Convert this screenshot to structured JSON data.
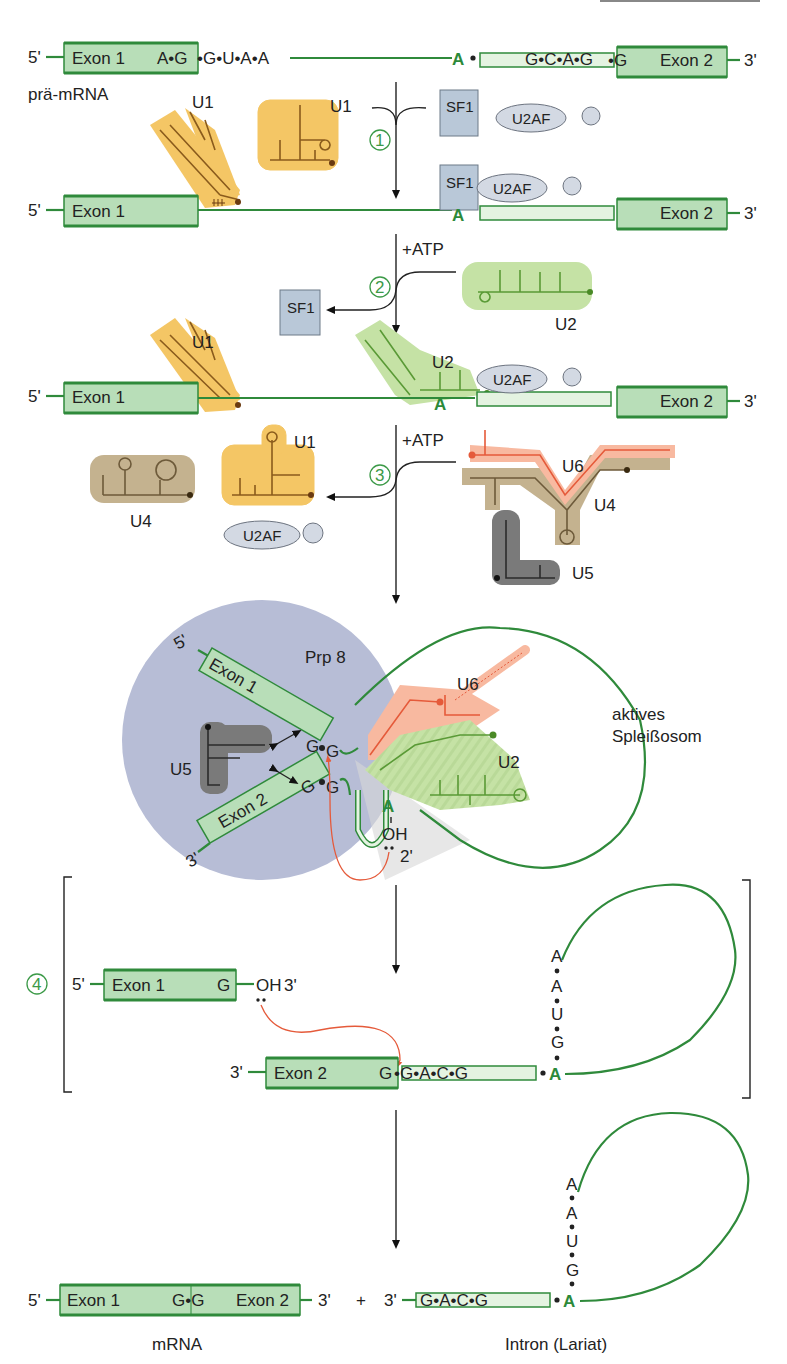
{
  "diagram": {
    "colors": {
      "exon_fill": "#b8deb8",
      "rna_green": "#2f8a3b",
      "u1": "#f4c665",
      "u2": "#c5e2a5",
      "u4": "#c4b28f",
      "u5": "#7a7a7a",
      "u6": "#f8b9a0",
      "sf1": "#b9c8d8",
      "u2af": "#d3d9e3",
      "spliceosome_bg": "#b7bdd6",
      "attack_arrow": "#e55a3a"
    },
    "row1": {
      "five_prime": "5'",
      "exon1": "Exon 1",
      "donor_seq_in_exon": "A•G",
      "donor_seq_intron": "•G•U•A•A",
      "branch_A": "A",
      "acceptor_seq": "G•C•A•G",
      "acceptor_junction": "•G",
      "exon2": "Exon 2",
      "three_prime": "3'",
      "label": "prä-mRNA"
    },
    "step1": {
      "number": "1",
      "u1_label": "U1",
      "u1_free_label": "U1",
      "sf1": "SF1",
      "u2af": "U2AF"
    },
    "row2": {
      "five_prime": "5'",
      "exon1": "Exon 1",
      "branch_A": "A",
      "sf1": "SF1",
      "u2af": "U2AF",
      "exon2": "Exon 2",
      "three_prime": "3'"
    },
    "step2": {
      "number": "2",
      "atp": "+ATP",
      "sf1_released": "SF1",
      "u2_incoming": "U2"
    },
    "row3": {
      "five_prime": "5'",
      "exon1": "Exon 1",
      "u1": "U1",
      "u2": "U2",
      "branch_A": "A",
      "u2af": "U2AF",
      "exon2": "Exon 2",
      "three_prime": "3'"
    },
    "step3": {
      "number": "3",
      "atp": "+ATP",
      "released_u4": "U4",
      "released_u1": "U1",
      "released_u2af": "U2AF",
      "tri_u6": "U6",
      "tri_u4": "U4",
      "tri_u5": "U5"
    },
    "active": {
      "protein": "Prp 8",
      "five_prime": "5'",
      "three_prime": "3'",
      "exon1": "Exon 1",
      "exon2": "Exon 2",
      "g1": "G",
      "g2": "G",
      "g3": "G",
      "g4": "G",
      "u5": "U5",
      "u6": "U6",
      "u2": "U2",
      "branch_A": "A",
      "oh": "OH",
      "two_prime": "2'",
      "label_line1": "aktives",
      "label_line2": "Spleißosom"
    },
    "step4": {
      "number": "4",
      "five_prime": "5'",
      "exon1": "Exon 1",
      "g_end": "G",
      "oh": "OH",
      "three_prime_oh": "3'",
      "three_prime": "3'",
      "exon2": "Exon 2",
      "g_exon2": "G",
      "intron_seq": "•G•A•C•G",
      "lariat_seq": [
        "A",
        "A",
        "U",
        "G"
      ],
      "branch_A": "A"
    },
    "final": {
      "five_prime": "5'",
      "exon1": "Exon 1",
      "junction": "G•G",
      "exon2": "Exon 2",
      "three_prime": "3'",
      "plus": "+",
      "intron_three_prime": "3'",
      "intron_seq": "G•A•C•G",
      "lariat_seq": [
        "A",
        "A",
        "U",
        "G"
      ],
      "branch_A": "A",
      "mrna_label": "mRNA",
      "intron_label": "Intron (Lariat)"
    }
  }
}
